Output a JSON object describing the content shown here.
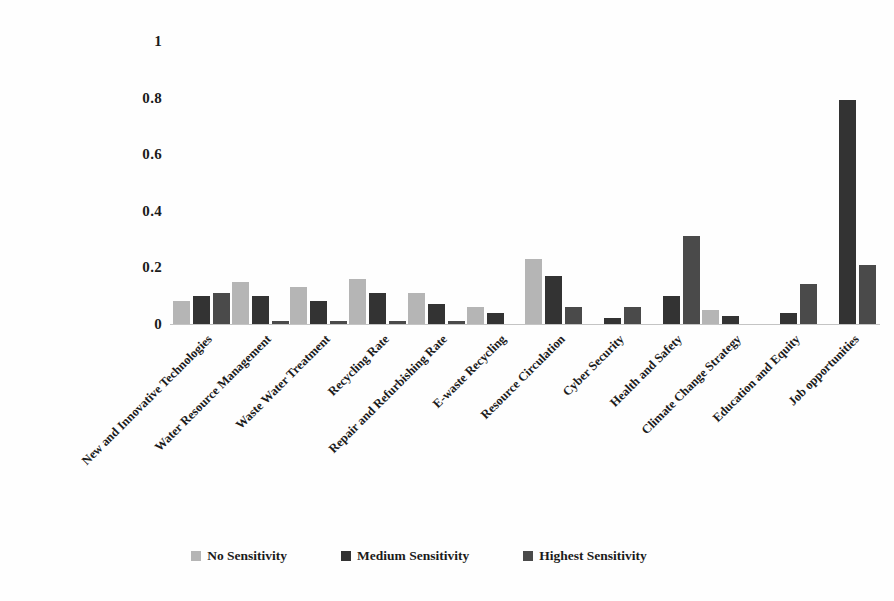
{
  "chart_data": {
    "type": "bar",
    "title": "",
    "xlabel": "",
    "ylabel": "",
    "categories": [
      "New and Innovative Technologies",
      "Water Resource Management",
      "Waste Water Treatment",
      "Recycling Rate",
      "Repair and Refurbishing Rate",
      "E-waste Recycling",
      "Resource Circulation",
      "Cyber Security",
      "Health and Safety",
      "Climate Change Strategy",
      "Education and Equity",
      "Job opportunities"
    ],
    "series": [
      {
        "name": "No Sensitivity",
        "color": "#b5b5b5",
        "values": [
          0.08,
          0.15,
          0.13,
          0.16,
          0.11,
          0.06,
          0.23,
          0.0,
          0.0,
          0.05,
          0.0,
          0.0
        ]
      },
      {
        "name": "Medium Sensitivity",
        "color": "#333333",
        "values": [
          0.1,
          0.1,
          0.08,
          0.11,
          0.07,
          0.04,
          0.17,
          0.02,
          0.1,
          0.03,
          0.04,
          0.79
        ]
      },
      {
        "name": "Highest Sensitivity",
        "color": "#4a4a4a",
        "values": [
          0.11,
          0.01,
          0.01,
          0.01,
          0.01,
          0.0,
          0.06,
          0.06,
          0.31,
          0.0,
          0.14,
          0.21
        ]
      }
    ],
    "ylim": [
      0,
      1
    ],
    "yticks": [
      "1",
      "0.8",
      "0.6",
      "0.4",
      "0.2",
      "0"
    ],
    "ytick_values": [
      1,
      0.8,
      0.6,
      0.4,
      0.2,
      0
    ],
    "grid": false,
    "legend_position": "bottom",
    "axis_color": "#c4c4c4",
    "text_color": "#1b1b1b"
  }
}
